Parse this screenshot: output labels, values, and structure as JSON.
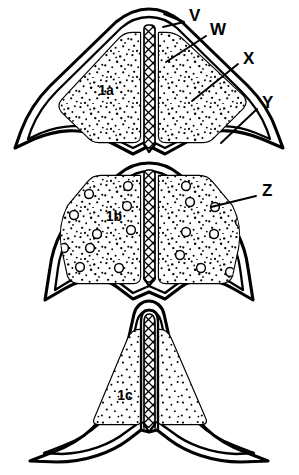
{
  "figure": {
    "background_color": "#ffffff",
    "ink_color": "#000000",
    "style": "black-and-white stippled line drawing"
  },
  "callouts": [
    {
      "id": "V",
      "label": "V",
      "x": 189,
      "y": 17,
      "leader": "M 184 22 L 164 14 M 184 22 L 163 27"
    },
    {
      "id": "W",
      "label": "W",
      "x": 210,
      "y": 31,
      "leader": "M 206 36 L 166 62"
    },
    {
      "id": "X",
      "label": "X",
      "x": 243,
      "y": 60,
      "leader": "M 238 64 L 192 101"
    },
    {
      "id": "Y",
      "label": "Y",
      "x": 262,
      "y": 104,
      "leader": "M 257 109 L 221 143"
    },
    {
      "id": "Z",
      "label": "Z",
      "x": 262,
      "y": 192,
      "leader": "M 256 196 L 211 207"
    }
  ],
  "sections": [
    {
      "id": "1a",
      "label": "1a",
      "x": 106,
      "y": 95,
      "description": "upper section, dense stipple, no vesicles"
    },
    {
      "id": "1b",
      "label": "1b",
      "x": 114,
      "y": 221,
      "description": "middle section, dense stipple with open vesicles"
    },
    {
      "id": "1c",
      "label": "1c",
      "x": 125,
      "y": 400,
      "description": "lower section, sparse stipple, narrow wings"
    }
  ],
  "features": {
    "septum_label": "central cross-hatched septum",
    "wall_layers": [
      "outer cuticle",
      "epidermis",
      "inner lining"
    ],
    "vesicle_label": "open circular vesicle"
  }
}
